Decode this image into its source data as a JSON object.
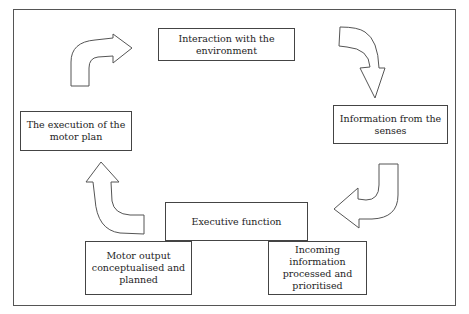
{
  "diagram": {
    "type": "cycle",
    "nodes": [
      {
        "id": "interaction",
        "label": "Interaction with the environment"
      },
      {
        "id": "senses",
        "label": "Information from the senses"
      },
      {
        "id": "executive",
        "label": "Executive function"
      },
      {
        "id": "incoming",
        "label": "Incoming information processed and prioritised"
      },
      {
        "id": "motor_output",
        "label": "Motor output conceptualised and planned"
      },
      {
        "id": "execution",
        "label": "The execution of the motor plan"
      }
    ],
    "edges": [
      {
        "from": "interaction",
        "to": "senses",
        "shape": "curved-arrow-down"
      },
      {
        "from": "senses",
        "to": "executive",
        "shape": "curved-arrow-left"
      },
      {
        "from": "motor_output",
        "to": "execution",
        "shape": "curved-arrow-up"
      },
      {
        "from": "execution",
        "to": "interaction",
        "shape": "curved-arrow-right"
      }
    ]
  },
  "colors": {
    "stroke": "#444444",
    "background": "#ffffff",
    "text": "#1e1e1e"
  }
}
